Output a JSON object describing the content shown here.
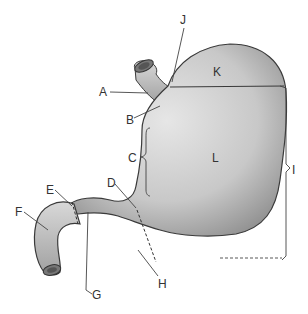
{
  "diagram": {
    "labels": [
      {
        "id": "A",
        "text": "A",
        "x": 99,
        "y": 86
      },
      {
        "id": "B",
        "text": "B",
        "x": 126,
        "y": 114
      },
      {
        "id": "C",
        "text": "C",
        "x": 127,
        "y": 153
      },
      {
        "id": "D",
        "text": "D",
        "x": 107,
        "y": 177
      },
      {
        "id": "E",
        "text": "E",
        "x": 46,
        "y": 185
      },
      {
        "id": "F",
        "text": "F",
        "x": 15,
        "y": 207
      },
      {
        "id": "G",
        "text": "G",
        "x": 92,
        "y": 290
      },
      {
        "id": "H",
        "text": "H",
        "x": 158,
        "y": 279
      },
      {
        "id": "I",
        "text": "I",
        "x": 291,
        "y": 169
      },
      {
        "id": "J",
        "text": "J",
        "x": 179,
        "y": 16
      },
      {
        "id": "K",
        "text": "K",
        "x": 213,
        "y": 66
      },
      {
        "id": "L",
        "text": "L",
        "x": 211,
        "y": 153
      }
    ],
    "colors": {
      "organ_fill": "#cfcfcf",
      "organ_shade": "#9a9a9a",
      "outline": "#3a3a3a",
      "leader": "#444444"
    }
  }
}
